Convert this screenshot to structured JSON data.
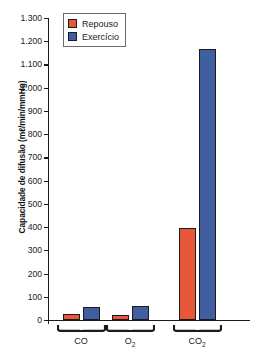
{
  "chart_data": {
    "type": "bar",
    "title": "",
    "xlabel": "",
    "ylabel": "Capacidade de difusão (mℓ/min/mmHg)",
    "categories": [
      "CO",
      "O₂",
      "CO₂"
    ],
    "category_labels": [
      {
        "text": "CO",
        "sub": ""
      },
      {
        "text": "O",
        "sub": "2"
      },
      {
        "text": "CO",
        "sub": "2"
      }
    ],
    "series": [
      {
        "name": "Repouso",
        "color": "#e8573a",
        "values": [
          25,
          22,
          395
        ]
      },
      {
        "name": "Exercício",
        "color": "#3f5fa0",
        "values": [
          55,
          62,
          1165
        ]
      }
    ],
    "ylim": [
      0,
      1300
    ],
    "ytick_values": [
      0,
      100,
      200,
      300,
      400,
      500,
      600,
      700,
      800,
      900,
      1000,
      1100,
      1200,
      1300
    ],
    "ytick_labels": [
      "0",
      "100",
      "200",
      "300",
      "400",
      "500",
      "600",
      "700",
      "800",
      "900",
      "1.000",
      "1.100",
      "1.200",
      "1.300"
    ],
    "grid": false,
    "legend_position": "top-left-inside",
    "axis_style": "left-and-bottom-only",
    "group_brace": true
  },
  "legend": {
    "entries": [
      {
        "label": "Repouso",
        "color": "#e8573a"
      },
      {
        "label": "Exercício",
        "color": "#3f5fa0"
      }
    ]
  },
  "colors": {
    "rest": "#e8573a",
    "exercise": "#3f5fa0",
    "axis": "#1a1a1a",
    "background": "#ffffff"
  }
}
